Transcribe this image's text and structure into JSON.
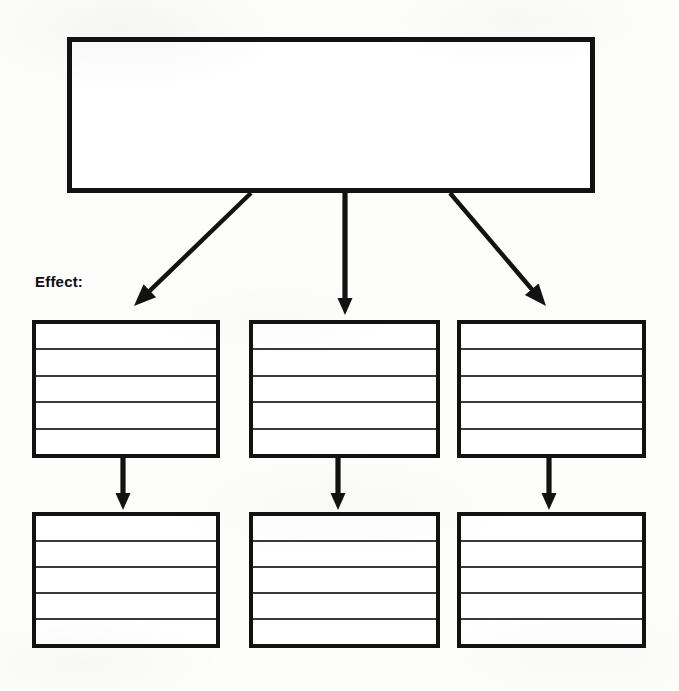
{
  "page": {
    "background_color": "#fdfdfc",
    "ink_color": "#121212"
  },
  "cause": {
    "label": "Cause",
    "label_font_size_px": 17,
    "box": {
      "x": 67,
      "y": 37,
      "width": 528,
      "height": 156
    },
    "label_position": {
      "x": 86,
      "y": 72
    }
  },
  "effect": {
    "label": "Effect:",
    "label_font_size_px": 15,
    "label_position": {
      "x": 35,
      "y": 273
    }
  },
  "layout": {
    "columns": [
      {
        "x": 32,
        "width": 188
      },
      {
        "x": 249,
        "width": 191
      },
      {
        "x": 457,
        "width": 189
      }
    ],
    "rows": [
      {
        "y": 320,
        "height": 138
      },
      {
        "y": 512,
        "height": 136
      }
    ],
    "rule_lines_per_box": 4,
    "writing_rows_per_box": 5
  },
  "effect_boxes": [
    {
      "id": "effect-1-1",
      "row": 1,
      "column": 1,
      "content": ""
    },
    {
      "id": "effect-1-2",
      "row": 1,
      "column": 2,
      "content": ""
    },
    {
      "id": "effect-1-3",
      "row": 1,
      "column": 3,
      "content": ""
    },
    {
      "id": "effect-2-1",
      "row": 2,
      "column": 1,
      "content": ""
    },
    {
      "id": "effect-2-2",
      "row": 2,
      "column": 2,
      "content": ""
    },
    {
      "id": "effect-2-3",
      "row": 2,
      "column": 3,
      "content": ""
    }
  ],
  "arrows": {
    "from_cause": [
      {
        "name": "cause-to-effect-left",
        "x1": 251,
        "y1": 193,
        "x2": 134,
        "y2": 306,
        "kind": "diagonal"
      },
      {
        "name": "cause-to-effect-middle",
        "x1": 345,
        "y1": 193,
        "x2": 345,
        "y2": 315,
        "kind": "vertical"
      },
      {
        "name": "cause-to-effect-right",
        "x1": 450,
        "y1": 193,
        "x2": 546,
        "y2": 306,
        "kind": "diagonal"
      }
    ],
    "between_rows": [
      {
        "name": "effect-row1-to-row2-col1",
        "x1": 123,
        "y1": 458,
        "x2": 123,
        "y2": 510,
        "kind": "vertical"
      },
      {
        "name": "effect-row1-to-row2-col2",
        "x1": 338,
        "y1": 458,
        "x2": 338,
        "y2": 510,
        "kind": "vertical"
      },
      {
        "name": "effect-row1-to-row2-col3",
        "x1": 549,
        "y1": 458,
        "x2": 549,
        "y2": 510,
        "kind": "vertical"
      }
    ]
  }
}
